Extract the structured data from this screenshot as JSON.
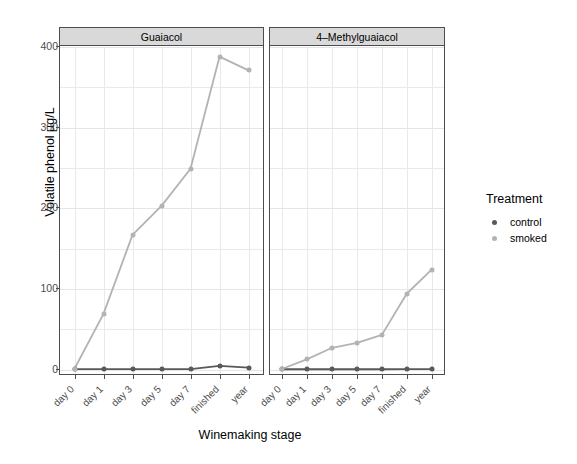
{
  "chart_data": {
    "type": "line",
    "title": "",
    "xlabel": "Winemaking stage",
    "ylabel": "Volatile phenol µg/L",
    "categories": [
      "day 0",
      "day 1",
      "day 3",
      "day 5",
      "day 7",
      "finished",
      "year"
    ],
    "ylim": [
      -8,
      400
    ],
    "yticks": [
      0,
      100,
      200,
      300,
      400
    ],
    "ytick_labels": [
      "0",
      "100",
      "200",
      "300",
      "400"
    ],
    "grid": true,
    "legend": {
      "title": "Treatment",
      "position": "right",
      "entries": [
        {
          "label": "control",
          "color": "#595959"
        },
        {
          "label": "smoked",
          "color": "#b3b3b3"
        }
      ]
    },
    "facets": [
      {
        "label": "Guaiacol",
        "series": [
          {
            "name": "control",
            "color": "#595959",
            "values": [
              0.5,
              0.5,
              0.6,
              0.6,
              0.6,
              4.5,
              2.5
            ]
          },
          {
            "name": "smoked",
            "color": "#b3b3b3",
            "values": [
              1.0,
              69,
              167,
              203,
              249,
              388,
              371
            ]
          }
        ]
      },
      {
        "label": "4–Methylguaiacol",
        "series": [
          {
            "name": "control",
            "color": "#595959",
            "values": [
              0.4,
              0.4,
              0.4,
              0.4,
              0.4,
              0.5,
              0.5
            ]
          },
          {
            "name": "smoked",
            "color": "#b3b3b3",
            "values": [
              1.0,
              13,
              27,
              33,
              43,
              94,
              124
            ]
          }
        ]
      }
    ]
  },
  "colors": {
    "panel_strip": "#d9d9d9",
    "panel_border": "#4d4d4d",
    "grid": "#e8e8ee",
    "background": "#ffffff",
    "axis_text": "#4d4d4d",
    "title_text": "#000000"
  }
}
